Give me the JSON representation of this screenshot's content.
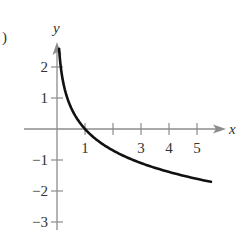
{
  "panel_label": ")",
  "colors": {
    "axis": "#8c8c8c",
    "curve": "#111111",
    "text": "#333333"
  },
  "chart_data": {
    "type": "line",
    "title": "",
    "xlabel": "x",
    "ylabel": "y",
    "function": "y = -ln(x)",
    "xlim": [
      0,
      5.9
    ],
    "ylim": [
      -3.2,
      2.8
    ],
    "x_ticks": [
      1,
      2,
      3,
      4,
      5
    ],
    "x_tick_labels": [
      "1",
      "",
      "3",
      "4",
      "5"
    ],
    "y_ticks": [
      -3,
      -2,
      -1,
      1,
      2
    ],
    "y_tick_labels": [
      "−3",
      "−2",
      "−1",
      "1",
      "2"
    ],
    "grid": false,
    "legend": null,
    "series": [
      {
        "name": "curve",
        "x": [
          0.075,
          0.1,
          0.15,
          0.2,
          0.3,
          0.4,
          0.5,
          0.7,
          1,
          1.5,
          2,
          2.5,
          3,
          3.5,
          4,
          4.5,
          5,
          5.5
        ],
        "y": [
          2.59,
          2.3,
          1.9,
          1.61,
          1.2,
          0.92,
          0.69,
          0.36,
          0,
          -0.41,
          -0.69,
          -0.92,
          -1.1,
          -1.25,
          -1.39,
          -1.5,
          -1.61,
          -1.7
        ]
      }
    ]
  }
}
